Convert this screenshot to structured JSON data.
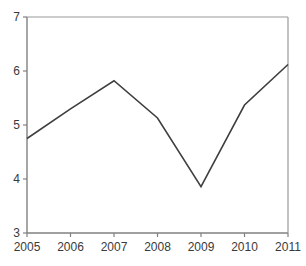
{
  "chart_data": {
    "type": "line",
    "title": "",
    "subtitle": "",
    "xlabel": "",
    "ylabel": "",
    "categories": [
      "2005",
      "2006",
      "2007",
      "2008",
      "2009",
      "2010",
      "2011"
    ],
    "x": [
      2005,
      2006,
      2007,
      2008,
      2009,
      2010,
      2011
    ],
    "values": [
      4.75,
      5.3,
      5.82,
      5.13,
      3.86,
      5.37,
      6.12
    ],
    "series": [
      {
        "name": "",
        "values": [
          4.75,
          5.3,
          5.82,
          5.13,
          3.86,
          5.37,
          6.12
        ]
      }
    ],
    "xlim": [
      2005,
      2011
    ],
    "ylim": [
      3,
      7
    ],
    "yticks": [
      3,
      4,
      5,
      6,
      7
    ],
    "ytick_labels": [
      "3",
      "4",
      "5",
      "6",
      "7"
    ],
    "xticks": [
      2005,
      2006,
      2007,
      2008,
      2009,
      2010,
      2011
    ],
    "xtick_labels": [
      "2005",
      "2006",
      "2007",
      "2008",
      "2009",
      "2010",
      "2011"
    ],
    "grid": false,
    "legend": false,
    "legend_position": "none",
    "line_color": "#3f3f3f",
    "axis_color": "#808080",
    "text_color": "#3a3a3a",
    "background_color": "#ffffff",
    "annotations": []
  },
  "axes": {
    "y": {
      "ticks": [
        {
          "label": "7",
          "value": 7
        },
        {
          "label": "6",
          "value": 6
        },
        {
          "label": "5",
          "value": 5
        },
        {
          "label": "4",
          "value": 4
        },
        {
          "label": "3",
          "value": 3
        }
      ]
    },
    "x": {
      "ticks": [
        {
          "label": "2005",
          "value": 2005
        },
        {
          "label": "2006",
          "value": 2006
        },
        {
          "label": "2007",
          "value": 2007
        },
        {
          "label": "2008",
          "value": 2008
        },
        {
          "label": "2009",
          "value": 2009
        },
        {
          "label": "2010",
          "value": 2010
        },
        {
          "label": "2011",
          "value": 2011
        }
      ]
    }
  }
}
